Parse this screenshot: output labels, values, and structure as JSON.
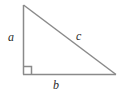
{
  "figure": {
    "name": "right-triangle-diagram",
    "shape": "right triangle",
    "background_color": "#ffffff",
    "stroke_color": "#8a8a8a",
    "label_color": "#2b2b2b",
    "stroke_width": 1.5
  },
  "labels": {
    "leg_vertical": "a",
    "hypotenuse": "c",
    "leg_horizontal": "b"
  },
  "geometry": {
    "vertex_top": [
      23,
      5
    ],
    "vertex_right_angle": [
      23,
      74
    ],
    "vertex_right": [
      116,
      74
    ],
    "right_angle_marker_size": 8
  }
}
